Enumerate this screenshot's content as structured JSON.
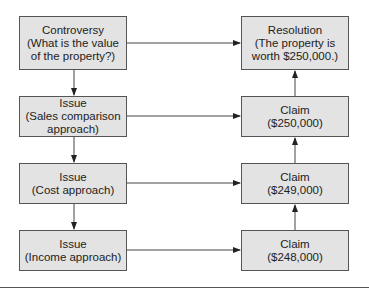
{
  "diagram": {
    "left_column": [
      {
        "id": "controversy",
        "lines": [
          "Controversy",
          "(What is the value",
          "of the property?)"
        ]
      },
      {
        "id": "issue-sales",
        "lines": [
          "Issue",
          "(Sales comparison",
          "approach)"
        ]
      },
      {
        "id": "issue-cost",
        "lines": [
          "Issue",
          "(Cost approach)"
        ]
      },
      {
        "id": "issue-income",
        "lines": [
          "Issue",
          "(Income approach)"
        ]
      }
    ],
    "right_column": [
      {
        "id": "resolution",
        "lines": [
          "Resolution",
          "(The property is",
          "worth $250,000.)"
        ]
      },
      {
        "id": "claim-250",
        "lines": [
          "Claim",
          "($250,000)"
        ]
      },
      {
        "id": "claim-249",
        "lines": [
          "Claim",
          "($249,000)"
        ]
      },
      {
        "id": "claim-248",
        "lines": [
          "Claim",
          "($248,000)"
        ]
      }
    ],
    "edges": [
      {
        "from": "controversy",
        "to": "issue-sales"
      },
      {
        "from": "issue-sales",
        "to": "issue-cost"
      },
      {
        "from": "issue-cost",
        "to": "issue-income"
      },
      {
        "from": "controversy",
        "to": "resolution"
      },
      {
        "from": "issue-sales",
        "to": "claim-250"
      },
      {
        "from": "issue-cost",
        "to": "claim-249"
      },
      {
        "from": "issue-income",
        "to": "claim-248"
      },
      {
        "from": "claim-248",
        "to": "claim-249"
      },
      {
        "from": "claim-249",
        "to": "claim-250"
      },
      {
        "from": "claim-250",
        "to": "resolution"
      }
    ],
    "colors": {
      "box_fill": "#e3e3e3",
      "box_border": "#555555",
      "line": "#333333"
    }
  }
}
